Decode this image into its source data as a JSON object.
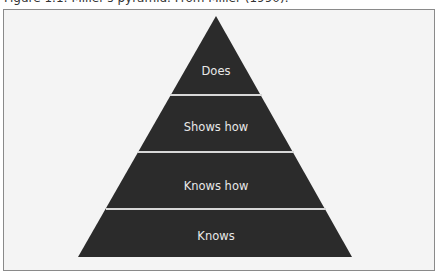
{
  "caption": "Figure 1.1: Miller's pyramid. From Miller (1990).",
  "pyramid": {
    "fill_color": "#2b2b2b",
    "divider_color": "#d8d8d8",
    "levels": [
      {
        "label": "Does"
      },
      {
        "label": "Shows how"
      },
      {
        "label": "Knows how"
      },
      {
        "label": "Knows"
      }
    ]
  }
}
